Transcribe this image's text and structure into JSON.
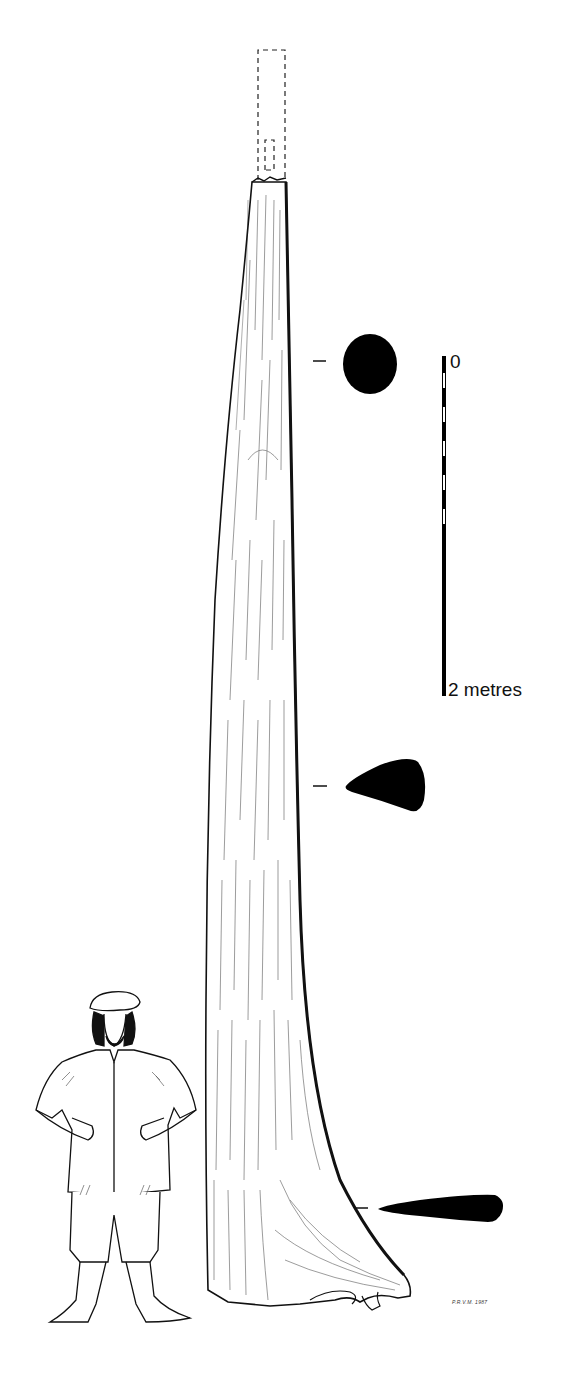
{
  "figure": {
    "scale_bar": {
      "top_label": "0",
      "bottom_label": "2 metres",
      "segments": 10
    },
    "sections": [
      {
        "name": "upper-section",
        "shape": "round",
        "y": 364
      },
      {
        "name": "middle-section",
        "shape": "pear",
        "y": 786
      },
      {
        "name": "lower-section",
        "shape": "elongated-teardrop",
        "y": 1208
      }
    ],
    "signature": "P.R.V.M. 1987",
    "colors": {
      "ink": "#111111",
      "paper": "#ffffff"
    }
  }
}
